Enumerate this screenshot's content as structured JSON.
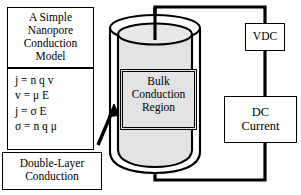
{
  "figure": {
    "type": "schematic-diagram",
    "background_color": "#ffffff",
    "line_color": "#000000",
    "cylinder_fill": "#e3e3e3"
  },
  "title_box": {
    "line1": "A Simple",
    "line2": "Nanopore",
    "line3": "Conduction",
    "line4": "Model"
  },
  "equation_box": {
    "equations": [
      "j = n q v",
      "v = μ E",
      "j = σ E",
      "σ = n q μ"
    ]
  },
  "double_layer_box": {
    "line1": "Double-Layer",
    "line2": "Conduction"
  },
  "bulk_region_box": {
    "line1": "Bulk",
    "line2": "Conduction",
    "line3": "Region"
  },
  "source_box": {
    "label": "VDC"
  },
  "meter_box": {
    "line1": "DC",
    "line2": "Current"
  },
  "annotations": {
    "arrow_name": "double-layer-pointer-arrow"
  }
}
